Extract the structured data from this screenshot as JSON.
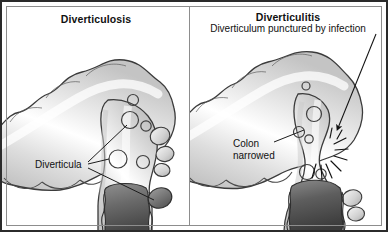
{
  "figure": {
    "type": "medical-illustration",
    "panel_count": 2,
    "background_color": "#ffffff",
    "border_color": "#2b2b2b",
    "inner_frame_color": "#8d8d8d",
    "text_color": "#111111"
  },
  "panels": {
    "left": {
      "title": "Diverticulosis",
      "labels": {
        "diverticula": "Diverticula"
      },
      "anatomy": {
        "structure": "haustrated colon in cutaway, multiple small mucosal out-pouchings (diverticula) visible as circular openings along the wall and as lateral sac-like bulges",
        "lumen_shade": "#5a5a5a",
        "wall_shade": "#e9e9e9",
        "outline_color": "#3a3a3a",
        "diverticula_openings": 5,
        "lateral_pouches": 3
      }
    },
    "right": {
      "title": "Diverticulitis",
      "subtitle": "Diverticulum punctured by infection",
      "labels": {
        "colon_narrowed": "Colon\nnarrowed",
        "colon_narrowed_line1": "Colon",
        "colon_narrowed_line2": "narrowed"
      },
      "anatomy": {
        "structure": "haustrated colon with inflamed, narrowed segment; one diverticulum has perforated, marked by a radiating burst and an arrow from the subtitle",
        "lumen_shade": "#4a4a4a",
        "wall_shade": "#e9e9e9",
        "outline_color": "#3a3a3a",
        "burst_marker": "radiating-lines",
        "burst_ray_count": 9,
        "arrow_from": "subtitle",
        "arrow_to": "perforation-site"
      }
    }
  },
  "icons": {
    "arrowhead": "arrow-down-left-icon",
    "burst": "burst-icon"
  }
}
